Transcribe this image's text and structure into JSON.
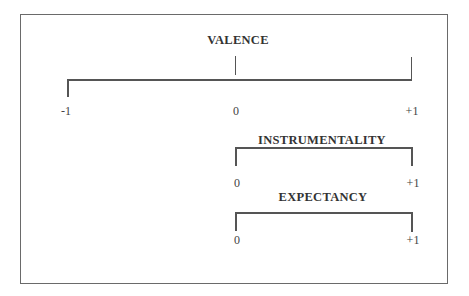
{
  "diagram": {
    "scales": [
      {
        "name": "valence",
        "label": "VALENCE",
        "min": "-1",
        "mid": "0",
        "max": "+1"
      },
      {
        "name": "instrumentality",
        "label": "INSTRUMENTALITY",
        "min": "0",
        "max": "+1"
      },
      {
        "name": "expectancy",
        "label": "EXPECTANCY",
        "min": "0",
        "max": "+1"
      }
    ]
  }
}
